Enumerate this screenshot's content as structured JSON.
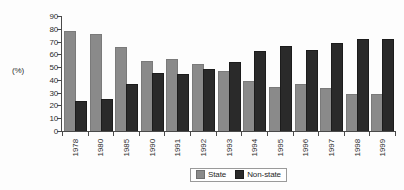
{
  "chart_data": {
    "type": "bar",
    "title": "",
    "subtitle": "",
    "xlabel": "",
    "ylabel": "(%)",
    "ylim": [
      0,
      90
    ],
    "yticks": [
      0,
      10,
      20,
      30,
      40,
      50,
      60,
      70,
      80,
      90
    ],
    "grid": false,
    "legend_position": "bottom-center",
    "categories": [
      "1978",
      "1980",
      "1985",
      "1990",
      "1991",
      "1992",
      "1993",
      "1994",
      "1995",
      "1996",
      "1997",
      "1998",
      "1999"
    ],
    "series": [
      {
        "name": "State",
        "color": "#8a8a8a",
        "values": [
          77.5,
          75.5,
          65,
          54,
          55.5,
          52,
          46.5,
          38,
          34,
          36,
          32.5,
          28.5,
          28.5
        ]
      },
      {
        "name": "Non-state",
        "color": "#2a2a2a",
        "values": [
          22.5,
          24.5,
          36,
          45,
          44,
          48,
          53.5,
          62,
          66,
          63,
          68,
          71.5,
          71.5
        ]
      }
    ]
  },
  "axes": {
    "y_title": "(%)",
    "y_tick_labels": [
      "90",
      "80",
      "70",
      "60",
      "50",
      "40",
      "30",
      "20",
      "10",
      "0"
    ]
  },
  "legend": {
    "entries": [
      {
        "label": "State",
        "swatch": "state-swatch"
      },
      {
        "label": "Non-state",
        "swatch": "nonstate-swatch"
      }
    ]
  }
}
